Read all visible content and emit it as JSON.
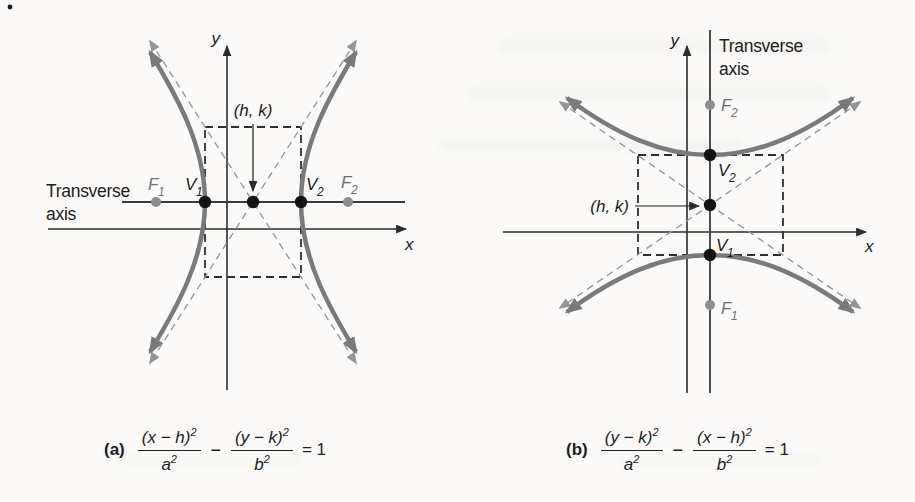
{
  "figure": {
    "description_colors": {
      "paper": "#fbfaf8",
      "curve": "#7a7a7a",
      "asymptote": "#949494",
      "axis_ink": "#2b2b2b",
      "focus_dot": "#8d8d8d",
      "vertex_dot": "#141414"
    }
  },
  "panel_a": {
    "y_label": "y",
    "x_label": "x",
    "transverse_1": "Transverse",
    "transverse_2": "axis",
    "center_label": "(h, k)",
    "f1": {
      "letter": "F",
      "sub": "1"
    },
    "v1": {
      "letter": "V",
      "sub": "1"
    },
    "v2": {
      "letter": "V",
      "sub": "2"
    },
    "f2": {
      "letter": "F",
      "sub": "2"
    },
    "eq": {
      "label": "(a)",
      "num1": "(x − h)",
      "exp1": "2",
      "den1": "a",
      "den1_exp": "2",
      "minus": "−",
      "num2": "(y − k)",
      "exp2": "2",
      "den2": "b",
      "den2_exp": "2",
      "rhs": "= 1"
    }
  },
  "panel_b": {
    "y_label": "y",
    "x_label": "x",
    "transverse_1": "Transverse",
    "transverse_2": "axis",
    "center_label": "(h, k)",
    "f2": {
      "letter": "F",
      "sub": "2"
    },
    "v2": {
      "letter": "V",
      "sub": "2"
    },
    "v1": {
      "letter": "V",
      "sub": "1"
    },
    "f1": {
      "letter": "F",
      "sub": "1"
    },
    "eq": {
      "label": "(b)",
      "num1": "(y − k)",
      "exp1": "2",
      "den1": "a",
      "den1_exp": "2",
      "minus": "−",
      "num2": "(x − h)",
      "exp2": "2",
      "den2": "b",
      "den2_exp": "2",
      "rhs": "= 1"
    }
  }
}
